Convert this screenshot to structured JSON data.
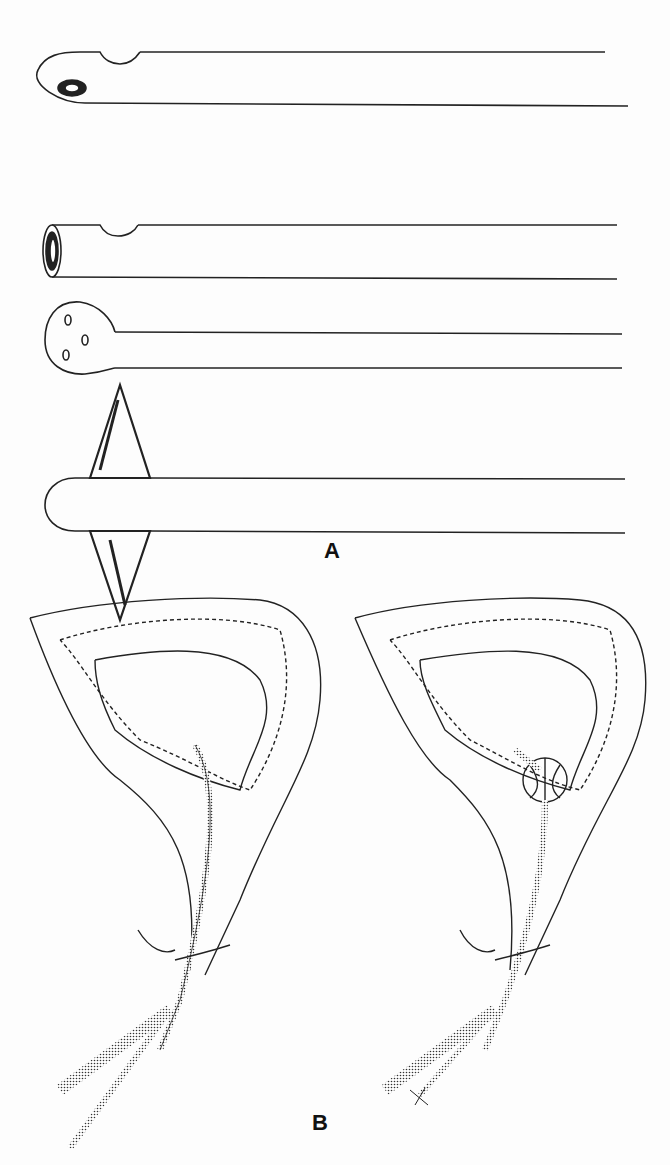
{
  "figure": {
    "panel_a": {
      "label": "A",
      "items": [
        "catheter-whistle-tip",
        "catheter-open-end",
        "catheter-mushroom-tip",
        "catheter-malecot-tip"
      ]
    },
    "panel_b": {
      "label": "B",
      "items": [
        "bladder-catheter-uninflated",
        "bladder-catheter-balloon-inflated-tied"
      ]
    }
  }
}
